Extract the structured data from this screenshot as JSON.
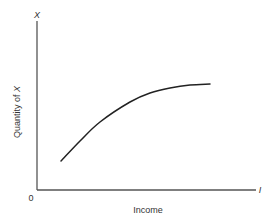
{
  "diagram": {
    "type": "line",
    "title": "",
    "x_axis": {
      "label": "Income",
      "end_symbol": "I",
      "origin_label": "0"
    },
    "y_axis": {
      "label_prefix": "Quantity of ",
      "label_variable": "X",
      "end_symbol": "X"
    },
    "curve": {
      "description": "Increasing, concave curve (quantity of X rises with income at a diminishing rate)",
      "points_px": [
        [
          61,
          161
        ],
        [
          80,
          141
        ],
        [
          100,
          122
        ],
        [
          130,
          102
        ],
        [
          150,
          93
        ],
        [
          170,
          88
        ],
        [
          190,
          85
        ],
        [
          210,
          84
        ]
      ]
    },
    "colors": {
      "axis": "#555555",
      "curve": "#222222",
      "text": "#333333",
      "background": "#ffffff"
    }
  },
  "chart_data": {
    "type": "line",
    "title": "",
    "xlabel": "Income",
    "ylabel": "Quantity of X",
    "x_end_label": "I",
    "y_end_label": "X",
    "origin": "0",
    "grid": false,
    "legend": null,
    "series": [
      {
        "name": "Engel curve",
        "shape": "concave increasing",
        "x": [
          0.11,
          0.2,
          0.29,
          0.42,
          0.51,
          0.6,
          0.69,
          0.78
        ],
        "y": [
          0.17,
          0.29,
          0.4,
          0.52,
          0.57,
          0.6,
          0.62,
          0.63
        ]
      }
    ],
    "xlim": [
      0,
      1
    ],
    "ylim": [
      0,
      1
    ]
  }
}
